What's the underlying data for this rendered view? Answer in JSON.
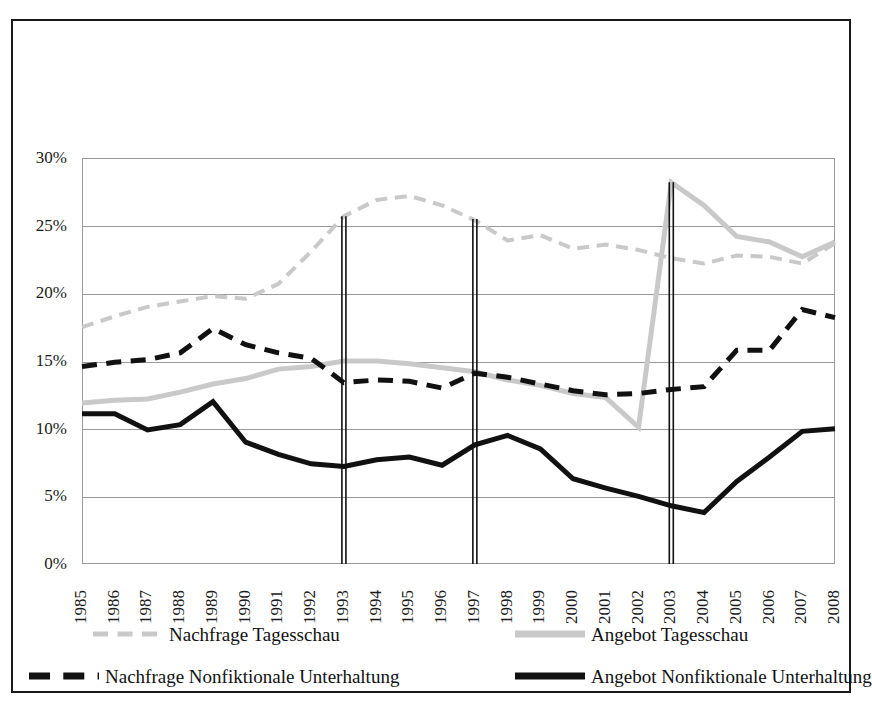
{
  "chart_data": {
    "type": "line",
    "title": "",
    "subtitle": "",
    "xlabel": "",
    "ylabel": "",
    "x": [
      1985,
      1986,
      1987,
      1988,
      1989,
      1990,
      1991,
      1992,
      1993,
      1994,
      1995,
      1996,
      1997,
      1998,
      1999,
      2000,
      2001,
      2002,
      2003,
      2004,
      2005,
      2006,
      2007,
      2008
    ],
    "xtick_labels": [
      "1985",
      "1986",
      "1987",
      "1988",
      "1989",
      "1990",
      "1991",
      "1992",
      "1993",
      "1994",
      "1995",
      "1996",
      "1997",
      "1998",
      "1999",
      "2000",
      "2001",
      "2002",
      "2003",
      "2004",
      "2005",
      "2006",
      "2007",
      "2008"
    ],
    "ytick_labels": [
      "0%",
      "5%",
      "10%",
      "15%",
      "20%",
      "25%",
      "30%"
    ],
    "ytick_values": [
      0,
      5,
      10,
      15,
      20,
      25,
      30
    ],
    "ylim": [
      0,
      30
    ],
    "xlim": [
      1985,
      2008
    ],
    "grid": true,
    "legend_position": "bottom",
    "series": [
      {
        "name": "Nachfrage Tagesschau",
        "style": "dashed",
        "color": "#c9c9c9",
        "width": 4,
        "values": [
          17.5,
          18.3,
          19.0,
          19.4,
          19.8,
          19.6,
          20.7,
          23.1,
          25.7,
          26.9,
          27.2,
          26.5,
          25.4,
          23.9,
          24.3,
          23.3,
          23.6,
          23.2,
          22.6,
          22.2,
          22.8,
          22.7,
          22.2,
          23.7
        ]
      },
      {
        "name": "Angebot Tagesschau",
        "style": "solid",
        "color": "#c9c9c9",
        "width": 5,
        "values": [
          11.9,
          12.1,
          12.2,
          12.7,
          13.3,
          13.7,
          14.4,
          14.6,
          15.0,
          15.0,
          14.8,
          14.5,
          14.2,
          13.6,
          13.2,
          12.6,
          12.3,
          10.1,
          28.2,
          26.5,
          24.2,
          23.8,
          22.7,
          23.8
        ]
      },
      {
        "name": "Nachfrage Nonfiktionale Unterhaltung",
        "style": "dashed",
        "color": "#111111",
        "width": 5,
        "values": [
          14.6,
          14.9,
          15.1,
          15.6,
          17.4,
          16.2,
          15.6,
          15.2,
          13.4,
          13.6,
          13.5,
          13.0,
          14.1,
          13.8,
          13.3,
          12.8,
          12.5,
          12.6,
          12.9,
          13.1,
          15.8,
          15.8,
          18.8,
          18.2
        ]
      },
      {
        "name": "Angebot Nonfiktionale Unterhaltung",
        "style": "solid",
        "color": "#111111",
        "width": 5,
        "values": [
          11.1,
          11.1,
          9.9,
          10.3,
          12.0,
          9.0,
          8.1,
          7.4,
          7.2,
          7.7,
          7.9,
          7.3,
          8.8,
          9.5,
          8.5,
          6.3,
          5.6,
          5.0,
          4.3,
          3.8,
          6.1,
          7.9,
          9.8,
          10.0
        ]
      }
    ],
    "vertical_markers": [
      {
        "label": "1993",
        "x": 1993,
        "y_top": 25.7
      },
      {
        "label": "1997",
        "x": 1997,
        "y_top": 25.5
      },
      {
        "label": "2003",
        "x": 2003,
        "y_top": 28.2
      }
    ]
  },
  "legend": {
    "items": [
      {
        "label": "Nachfrage Tagesschau",
        "swatch": "dashed-gray"
      },
      {
        "label": "Angebot Tagesschau",
        "swatch": "solid-gray"
      },
      {
        "label": "Nachfrage Nonfiktionale Unterhaltung",
        "swatch": "dashed-black"
      },
      {
        "label": "Angebot Nonfiktionale Unterhaltung",
        "swatch": "solid-black"
      }
    ]
  },
  "colors": {
    "gray_series": "#c9c9c9",
    "black_series": "#111111",
    "gridline": "#9a9a9a",
    "frame": "#1a1a1a",
    "background": "#ffffff"
  }
}
